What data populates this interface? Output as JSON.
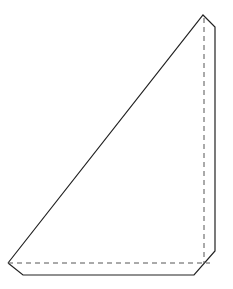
{
  "diagram": {
    "type": "folding-diagram",
    "stroke_color": "#222222",
    "solid_outline": [
      [
        8,
        263
      ],
      [
        203,
        15
      ],
      [
        215,
        27
      ],
      [
        215,
        251
      ],
      [
        194,
        275
      ],
      [
        23,
        275
      ],
      [
        8,
        263
      ]
    ],
    "fold_lines": [
      {
        "name": "bottom-fold",
        "from": [
          8,
          263
        ],
        "to": [
          210,
          263
        ],
        "style": "dashed"
      },
      {
        "name": "right-fold",
        "from": [
          204,
          18
        ],
        "to": [
          204,
          263
        ],
        "style": "dashed"
      }
    ],
    "cropped_caption_fragments": [
      "",
      ""
    ]
  }
}
